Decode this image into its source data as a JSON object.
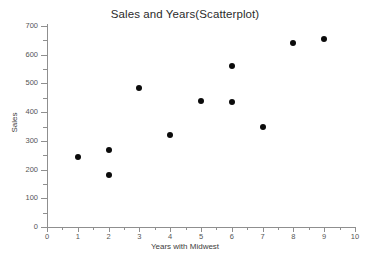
{
  "chart_data": {
    "type": "scatter",
    "title": "Sales and Years(Scatterplot)",
    "xlabel": "Years with Midwest",
    "ylabel": "Sales",
    "xlim": [
      0,
      10
    ],
    "ylim": [
      0,
      700
    ],
    "x_ticks": [
      "0",
      "1",
      "2",
      "3",
      "4",
      "5",
      "6",
      "7",
      "8",
      "9",
      "10"
    ],
    "y_ticks": [
      "0",
      "100",
      "200",
      "300",
      "400",
      "500",
      "600",
      "700"
    ],
    "x_tick_values": [
      0,
      1,
      2,
      3,
      4,
      5,
      6,
      7,
      8,
      9,
      10
    ],
    "y_tick_values": [
      0,
      100,
      200,
      300,
      400,
      500,
      600,
      700
    ],
    "x_minor_step": 0.5,
    "y_minor_step": 50,
    "grid": false,
    "legend": false,
    "marker_color": "#0b0b0b",
    "axis_color": "#8f8f8f",
    "background": "#ffffff",
    "points": [
      {
        "x": 1,
        "y": 244
      },
      {
        "x": 2,
        "y": 268
      },
      {
        "x": 2,
        "y": 181
      },
      {
        "x": 3,
        "y": 484
      },
      {
        "x": 4,
        "y": 320
      },
      {
        "x": 5,
        "y": 439
      },
      {
        "x": 6,
        "y": 560
      },
      {
        "x": 6,
        "y": 435
      },
      {
        "x": 7,
        "y": 348
      },
      {
        "x": 8,
        "y": 641
      },
      {
        "x": 9,
        "y": 655
      }
    ]
  }
}
